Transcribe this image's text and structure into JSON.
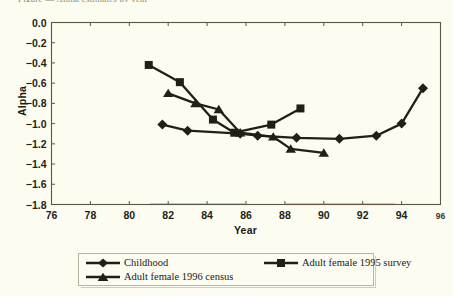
{
  "page": {
    "cut_title_fragment": "Figure — Alpha estimates by year",
    "background_color": "#fdfcf0",
    "ink_color": "#231f16"
  },
  "chart_data": {
    "type": "line",
    "title": "",
    "xlabel": "Year",
    "ylabel": "Alpha",
    "xlim": [
      76,
      96
    ],
    "ylim": [
      -1.8,
      0.0
    ],
    "xticks": [
      76,
      78,
      80,
      82,
      84,
      86,
      88,
      90,
      92,
      94,
      96
    ],
    "xtick_labels": [
      "76",
      "78",
      "80",
      "82",
      "84",
      "86",
      "88",
      "90",
      "92",
      "94",
      "96"
    ],
    "yticks": [
      0.0,
      -0.2,
      -0.4,
      -0.6,
      -0.8,
      -1.0,
      -1.2,
      -1.4,
      -1.6,
      -1.8
    ],
    "ytick_labels": [
      "0.0",
      "-0.2",
      "-0.4",
      "-0.6",
      "-0.8",
      "-1.0",
      "-1.2",
      "-1.4",
      "-1.6",
      "-1.8"
    ],
    "grid": false,
    "legend_position": "below-plot",
    "series": [
      {
        "name": "Childhood",
        "marker": "diamond",
        "x": [
          81.7,
          83.0,
          85.7,
          86.6,
          88.6,
          90.8,
          92.7,
          94.0,
          95.1
        ],
        "y": [
          -1.01,
          -1.07,
          -1.1,
          -1.12,
          -1.14,
          -1.15,
          -1.12,
          -1.0,
          -0.65
        ]
      },
      {
        "name": "Adult female 1995 survey",
        "marker": "square",
        "x": [
          81.0,
          82.6,
          84.3,
          85.4,
          87.3,
          88.8
        ],
        "y": [
          -0.42,
          -0.59,
          -0.96,
          -1.09,
          -1.01,
          -0.85
        ]
      },
      {
        "name": "Adult female 1996 census",
        "marker": "triangle",
        "x": [
          82.0,
          83.4,
          84.6,
          85.7,
          87.4,
          88.3,
          90.0
        ],
        "y": [
          -0.7,
          -0.8,
          -0.86,
          -1.09,
          -1.13,
          -1.25,
          -1.29
        ]
      }
    ]
  },
  "legend": {
    "items": [
      {
        "label": "Childhood",
        "marker": "diamond"
      },
      {
        "label": "Adult female 1995 survey",
        "marker": "square"
      },
      {
        "label": "Adult female 1996 census",
        "marker": "triangle"
      }
    ]
  }
}
